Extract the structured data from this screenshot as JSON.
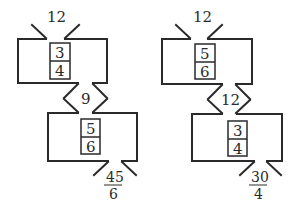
{
  "diagrams": [
    {
      "name": "left-function-machine-chain",
      "input": "12",
      "machine1": {
        "numerator": "3",
        "denominator": "4"
      },
      "intermediate": "9",
      "machine2": {
        "numerator": "5",
        "denominator": "6"
      },
      "output": {
        "numerator": "45",
        "denominator": "6"
      }
    },
    {
      "name": "right-function-machine-chain",
      "input": "12",
      "machine1": {
        "numerator": "5",
        "denominator": "6"
      },
      "intermediate": "12",
      "machine2": {
        "numerator": "3",
        "denominator": "4"
      },
      "output": {
        "numerator": "30",
        "denominator": "4"
      }
    }
  ]
}
